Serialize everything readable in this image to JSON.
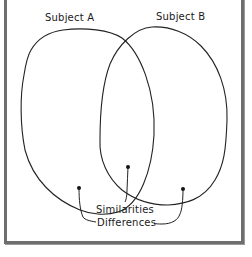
{
  "diagram": {
    "type": "venn",
    "sets": [
      {
        "label": "Subject A"
      },
      {
        "label": "Subject B"
      }
    ],
    "callouts": {
      "similarities": "Similarities",
      "differences": "Differences"
    },
    "colors": {
      "frame": "#6e6e6e",
      "stroke": "#222222",
      "text": "#1a1a1a"
    }
  }
}
